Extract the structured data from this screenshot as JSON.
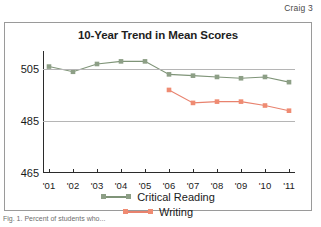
{
  "page": {
    "header_text": "Craig 3",
    "caption": "Fig. 1. Percent of students who..."
  },
  "chart_data": {
    "type": "line",
    "title": "10-Year Trend in Mean Scores",
    "xlabel": "",
    "ylabel": "",
    "x": [
      "'01",
      "'02",
      "'03",
      "'04",
      "'05",
      "'06",
      "'07",
      "'08",
      "'09",
      "'10",
      "'11"
    ],
    "ylim": [
      465,
      512
    ],
    "yticks": [
      465,
      485,
      505
    ],
    "ytick_labels": [
      "465",
      "485",
      "505"
    ],
    "grid": true,
    "legend_position": "bottom",
    "series": [
      {
        "name": "Critical Reading",
        "color": "#7f9478",
        "marker_color": "#8d9f86",
        "values": [
          506,
          504,
          507,
          508,
          508,
          503,
          502.5,
          502,
          501.5,
          502,
          500
        ]
      },
      {
        "name": "Writing",
        "color": "#e8826e",
        "marker_color": "#ef8b72",
        "values": [
          null,
          null,
          null,
          null,
          null,
          497,
          492,
          492.5,
          492.5,
          491,
          489
        ]
      }
    ]
  },
  "colors": {
    "critical_reading": "#7f9478",
    "writing": "#e8826e",
    "axis": "#2b2b2b",
    "grid": "#b5b5b5",
    "frame": "#9a9a9a"
  }
}
